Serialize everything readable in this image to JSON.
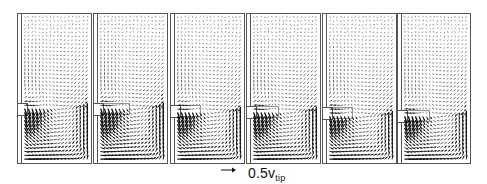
{
  "figure": {
    "panel_count": 6,
    "panels": [
      {
        "index": 1,
        "x": 17,
        "y": 13,
        "w": 74,
        "h": 150,
        "impeller_y": 103,
        "impeller_h": 12,
        "impeller_ext": 0,
        "intensity": 1.0
      },
      {
        "index": 2,
        "x": 93,
        "y": 13,
        "w": 74,
        "h": 150,
        "impeller_y": 103,
        "impeller_h": 12,
        "impeller_ext": 26,
        "intensity": 1.1
      },
      {
        "index": 3,
        "x": 170,
        "y": 13,
        "w": 74,
        "h": 150,
        "impeller_y": 105,
        "impeller_h": 12,
        "impeller_ext": 20,
        "intensity": 1.0
      },
      {
        "index": 4,
        "x": 246,
        "y": 13,
        "w": 74,
        "h": 150,
        "impeller_y": 106,
        "impeller_h": 12,
        "impeller_ext": 22,
        "intensity": 1.05
      },
      {
        "index": 5,
        "x": 322,
        "y": 13,
        "w": 74,
        "h": 150,
        "impeller_y": 107,
        "impeller_h": 12,
        "impeller_ext": 20,
        "intensity": 1.0
      },
      {
        "index": 6,
        "x": 397,
        "y": 13,
        "w": 73,
        "h": 150,
        "impeller_y": 110,
        "impeller_h": 12,
        "impeller_ext": 22,
        "intensity": 1.0
      }
    ],
    "colors": {
      "frame": "#555555",
      "vector": "#111111",
      "background": "#ffffff"
    },
    "grid": {
      "cols": 18,
      "rows": 38
    }
  },
  "legend": {
    "arrow_icon": "right-arrow",
    "label_main": "0.5v",
    "label_sub": "tip"
  }
}
